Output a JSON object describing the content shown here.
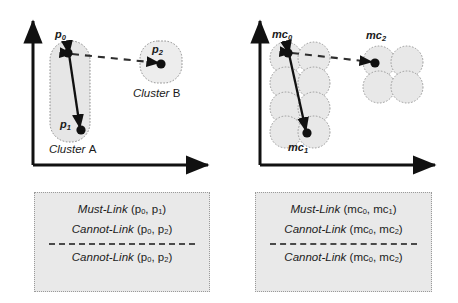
{
  "figure": {
    "panels": [
      {
        "id": "panel-left",
        "axis": {
          "x_arrow": true,
          "y_arrow": true
        },
        "points": [
          {
            "name": "p0",
            "label_main": "p",
            "label_sub": "0"
          },
          {
            "name": "p1",
            "label_main": "p",
            "label_sub": "1"
          },
          {
            "name": "p2",
            "label_main": "p",
            "label_sub": "2"
          }
        ],
        "clusters": [
          {
            "name": "cluster-a",
            "label_italic": "Cluster",
            "label_plain": "A",
            "shape": "rounded-rect"
          },
          {
            "name": "cluster-b",
            "label_italic": "Cluster",
            "label_plain": "B",
            "shape": "rounded-square"
          }
        ],
        "links": [
          {
            "type": "must-link",
            "style": "solid",
            "from": "p0",
            "to": "p1"
          },
          {
            "type": "cannot-link",
            "style": "dashed",
            "from": "p0",
            "to": "p2"
          }
        ],
        "legend": {
          "lines": [
            {
              "relation": "Must-Link",
              "args": [
                {
                  "main": "p",
                  "sub": "0"
                },
                {
                  "main": "p",
                  "sub": "1"
                }
              ]
            },
            {
              "relation": "Cannot-Link",
              "args": [
                {
                  "main": "p",
                  "sub": "0"
                },
                {
                  "main": "p",
                  "sub": "2"
                }
              ]
            },
            {
              "separator": true
            },
            {
              "relation": "Cannot-Link",
              "args": [
                {
                  "main": "p",
                  "sub": "0"
                },
                {
                  "main": "p",
                  "sub": "2"
                }
              ]
            }
          ]
        }
      },
      {
        "id": "panel-right",
        "axis": {
          "x_arrow": true,
          "y_arrow": true
        },
        "points": [
          {
            "name": "mc0",
            "label_main": "mc",
            "label_sub": "0"
          },
          {
            "name": "mc1",
            "label_main": "mc",
            "label_sub": "1"
          },
          {
            "name": "mc2",
            "label_main": "mc",
            "label_sub": "2"
          }
        ],
        "clusters": [
          {
            "name": "microcluster-group-left",
            "shape": "circle-grid",
            "columns": 2,
            "rows": 4
          },
          {
            "name": "microcluster-group-right",
            "shape": "circle-grid",
            "columns": 2,
            "rows": 2
          }
        ],
        "links": [
          {
            "type": "must-link",
            "style": "solid",
            "from": "mc0",
            "to": "mc1"
          },
          {
            "type": "cannot-link",
            "style": "dashed",
            "from": "mc0",
            "to": "mc2"
          }
        ],
        "legend": {
          "lines": [
            {
              "relation": "Must-Link",
              "args": [
                {
                  "main": "mc",
                  "sub": "0"
                },
                {
                  "main": "mc",
                  "sub": "1"
                }
              ]
            },
            {
              "relation": "Cannot-Link",
              "args": [
                {
                  "main": "mc",
                  "sub": "0"
                },
                {
                  "main": "mc",
                  "sub": "2"
                }
              ]
            },
            {
              "separator": true
            },
            {
              "relation": "Cannot-Link",
              "args": [
                {
                  "main": "mc",
                  "sub": "0"
                },
                {
                  "main": "mc",
                  "sub": "2"
                }
              ]
            }
          ]
        }
      }
    ],
    "colors": {
      "axis": "#111111",
      "point": "#111111",
      "link_solid": "#111111",
      "link_dashed": "#3a3a3a",
      "cluster_fill": "#e6e6e6",
      "cluster_stroke": "#8c8c8c",
      "legend_fill": "#e9e9e9",
      "legend_stroke": "#9a9a9a",
      "text": "#1a1a1a",
      "background": "#ffffff"
    }
  }
}
